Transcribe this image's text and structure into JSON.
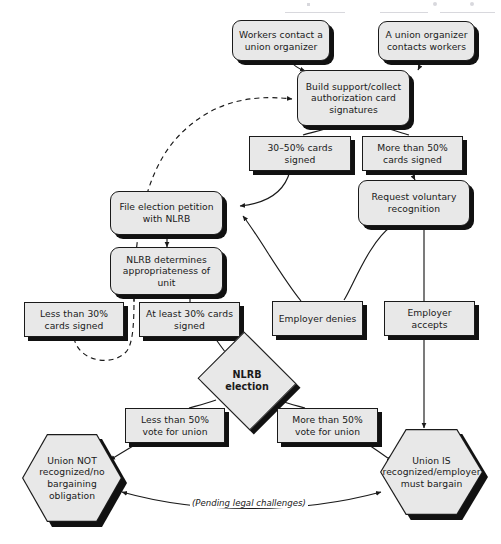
{
  "diagram": {
    "palette": {
      "node_fill": "#e8e8e8",
      "node_stroke": "#1a1a1a",
      "shadow": "#111111",
      "background": "#ffffff",
      "text": "#1a1a1a"
    },
    "nodes": [
      {
        "id": "workers_contact",
        "label": "Workers contact a union organizer",
        "shape": "rounded-rect"
      },
      {
        "id": "organizer_contacts",
        "label": "A union organizer contacts workers",
        "shape": "rounded-rect"
      },
      {
        "id": "build_support",
        "label": "Build support/collect authorization card signatures",
        "shape": "rounded-rect"
      },
      {
        "id": "cards_30_50",
        "label": "30–50% cards signed",
        "shape": "rect"
      },
      {
        "id": "cards_more_50",
        "label": "More than 50% cards signed",
        "shape": "rect"
      },
      {
        "id": "request_voluntary",
        "label": "Request voluntary recognition",
        "shape": "rounded-rect"
      },
      {
        "id": "file_petition",
        "label": "File election petition with NLRB",
        "shape": "rounded-rect"
      },
      {
        "id": "nlrb_determines",
        "label": "NLRB determines appropriateness of unit",
        "shape": "rounded-rect"
      },
      {
        "id": "less_than_30",
        "label": "Less than 30% cards signed",
        "shape": "rect"
      },
      {
        "id": "at_least_30",
        "label": "At least 30% cards signed",
        "shape": "rect"
      },
      {
        "id": "employer_denies",
        "label": "Employer denies",
        "shape": "rect"
      },
      {
        "id": "employer_accepts",
        "label": "Employer accepts",
        "shape": "rect"
      },
      {
        "id": "nlrb_election",
        "label": "NLRB election",
        "shape": "diamond"
      },
      {
        "id": "less_than_50_vote",
        "label": "Less than 50% vote for union",
        "shape": "rect"
      },
      {
        "id": "more_than_50_vote",
        "label": "More than 50% vote for union",
        "shape": "rect"
      },
      {
        "id": "union_not_recognized",
        "label": "Union NOT recognized/no bargaining obligation",
        "shape": "hexagon"
      },
      {
        "id": "union_is_recognized",
        "label": "Union IS recognized/employer must bargain",
        "shape": "hexagon"
      }
    ],
    "edge_labels": [
      {
        "id": "pending_legal",
        "label": "(Pending legal challenges)"
      }
    ],
    "edges": [
      {
        "from": "workers_contact",
        "to": "build_support",
        "style": "solid"
      },
      {
        "from": "organizer_contacts",
        "to": "build_support",
        "style": "solid"
      },
      {
        "from": "build_support",
        "to": "cards_30_50",
        "style": "solid"
      },
      {
        "from": "build_support",
        "to": "cards_more_50",
        "style": "solid"
      },
      {
        "from": "cards_30_50",
        "to": "file_petition",
        "style": "solid"
      },
      {
        "from": "cards_more_50",
        "to": "request_voluntary",
        "style": "solid"
      },
      {
        "from": "request_voluntary",
        "to": "employer_denies",
        "style": "solid"
      },
      {
        "from": "request_voluntary",
        "to": "employer_accepts",
        "style": "solid"
      },
      {
        "from": "employer_denies",
        "to": "file_petition",
        "style": "solid"
      },
      {
        "from": "file_petition",
        "to": "nlrb_determines",
        "style": "solid"
      },
      {
        "from": "nlrb_determines",
        "to": "less_than_30",
        "style": "solid"
      },
      {
        "from": "nlrb_determines",
        "to": "at_least_30",
        "style": "solid"
      },
      {
        "from": "less_than_30",
        "to": "build_support",
        "style": "dashed"
      },
      {
        "from": "at_least_30",
        "to": "nlrb_election",
        "style": "solid"
      },
      {
        "from": "nlrb_election",
        "to": "less_than_50_vote",
        "style": "solid"
      },
      {
        "from": "nlrb_election",
        "to": "more_than_50_vote",
        "style": "solid"
      },
      {
        "from": "less_than_50_vote",
        "to": "union_not_recognized",
        "style": "solid"
      },
      {
        "from": "more_than_50_vote",
        "to": "union_is_recognized",
        "style": "solid"
      },
      {
        "from": "employer_accepts",
        "to": "union_is_recognized",
        "style": "solid"
      },
      {
        "from": "union_is_recognized",
        "to": "union_not_recognized",
        "style": "solid",
        "label": "(Pending legal challenges)"
      }
    ]
  }
}
